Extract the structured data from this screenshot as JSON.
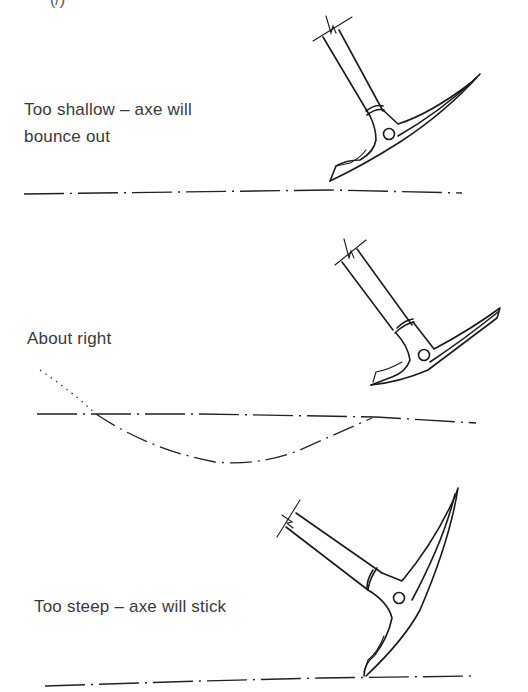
{
  "figure": {
    "corner_mark": "(/)",
    "panels": [
      {
        "id": "too-shallow",
        "caption_line1": "Too shallow  –  axe will",
        "caption_line2": "bounce out",
        "ground": "dash-dot line",
        "icons": [
          "ice-axe-icon",
          "ground-line-icon"
        ]
      },
      {
        "id": "about-right",
        "caption_line1": "About right",
        "ground": "dash-dot line",
        "swing_path": "dotted then dash-dot arc dipping below surface",
        "icons": [
          "ice-axe-icon",
          "ground-line-icon",
          "swing-arc-icon"
        ]
      },
      {
        "id": "too-steep",
        "caption_line1": "Too steep  –  axe will stick",
        "ground": "dash-dot line",
        "icons": [
          "ice-axe-icon",
          "ground-line-icon"
        ]
      }
    ]
  },
  "colors": {
    "ink": "#1a1a1a",
    "text": "#3a3a3a",
    "background": "#ffffff"
  }
}
